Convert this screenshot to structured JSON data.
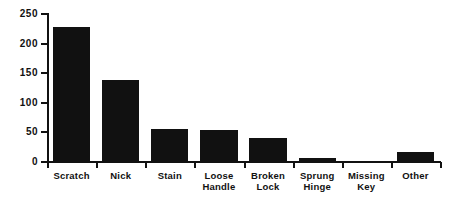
{
  "chart_data": {
    "type": "bar",
    "title": "",
    "subtitle": "",
    "xlabel": "",
    "ylabel": "",
    "categories": [
      "Scratch",
      "Nick",
      "Stain",
      "Loose Handle",
      "Broken Lock",
      "Sprung Hinge",
      "Missing Key",
      "Other"
    ],
    "category_lines": [
      [
        "Scratch"
      ],
      [
        "Nick"
      ],
      [
        "Stain"
      ],
      [
        "Loose",
        "Handle"
      ],
      [
        "Broken",
        "Lock"
      ],
      [
        "Sprung",
        "Hinge"
      ],
      [
        "Missing",
        "Key"
      ],
      [
        "Other"
      ]
    ],
    "values": [
      228,
      138,
      56,
      54,
      41,
      6,
      1,
      17
    ],
    "ylim": [
      0,
      250
    ],
    "ytick_values": [
      0,
      50,
      100,
      150,
      200,
      250
    ],
    "ytick_labels": [
      "0",
      "50",
      "100",
      "150",
      "200",
      "250"
    ],
    "grid": false,
    "legend": false,
    "legend_position": "none",
    "bar_color": "#111111",
    "axis_color": "#111111",
    "background_color": "#ffffff"
  }
}
